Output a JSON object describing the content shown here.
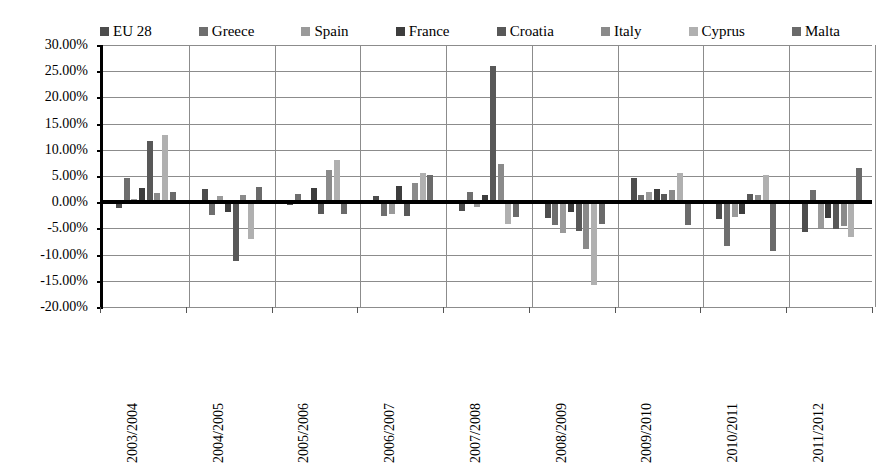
{
  "chart_data": {
    "type": "bar",
    "title": "",
    "subtitle": "",
    "xlabel": "",
    "ylabel": "",
    "ylim": [
      -20,
      30
    ],
    "ytick_step": 5,
    "ytick_labels": [
      "30.00%",
      "25.00%",
      "20.00%",
      "15.00%",
      "10.00%",
      "5.00%",
      "0.00%",
      "-5.00%",
      "-10.00%",
      "-15.00%",
      "-20.00%"
    ],
    "ytick_values": [
      30,
      25,
      20,
      15,
      10,
      5,
      0,
      -5,
      -10,
      -15,
      -20
    ],
    "grid": true,
    "legend_position": "top",
    "categories": [
      "2003/2004",
      "2004/2005",
      "2005/2006",
      "2006/2007",
      "2007/2008",
      "2008/2009",
      "2009/2010",
      "2010/2011",
      "2011/2012"
    ],
    "series": [
      {
        "name": "EU 28",
        "color": "#4d4d4d",
        "values": [
          -1.2,
          2.5,
          -0.6,
          1.2,
          -1.6,
          -3.0,
          4.6,
          -3.2,
          -5.6
        ]
      },
      {
        "name": "Greece",
        "color": "#6e6e6e",
        "values": [
          4.6,
          -2.4,
          1.5,
          -2.6,
          2.0,
          -4.4,
          1.3,
          -8.4,
          2.3
        ]
      },
      {
        "name": "Spain",
        "color": "#9a9a9a",
        "values": [
          0.6,
          1.2,
          -0.4,
          -2.2,
          -1.0,
          -5.8,
          2.0,
          -2.8,
          -5.0
        ]
      },
      {
        "name": "France",
        "color": "#3d3d3d",
        "values": [
          2.8,
          -1.8,
          2.7,
          3.0,
          1.4,
          -1.8,
          2.6,
          -2.2,
          -3.0
        ]
      },
      {
        "name": "Croatia",
        "color": "#585858",
        "values": [
          11.7,
          -11.3,
          -2.3,
          -2.6,
          26.0,
          -5.5,
          1.5,
          1.5,
          -5.2
        ]
      },
      {
        "name": "Italy",
        "color": "#8a8a8a",
        "values": [
          1.8,
          1.3,
          6.2,
          3.7,
          7.2,
          -9.0,
          2.3,
          1.4,
          -4.6
        ]
      },
      {
        "name": "Cyprus",
        "color": "#b0b0b0",
        "values": [
          12.8,
          -7.0,
          8.0,
          5.6,
          -4.2,
          -15.8,
          5.6,
          5.2,
          -6.6
        ]
      },
      {
        "name": "Malta",
        "color": "#6a6a6a",
        "values": [
          2.0,
          2.9,
          -2.2,
          5.2,
          -2.9,
          -4.1,
          -4.3,
          -9.3,
          6.6
        ]
      }
    ]
  },
  "legend": {
    "items": [
      {
        "label": "EU 28",
        "color": "#4d4d4d"
      },
      {
        "label": "Greece",
        "color": "#6e6e6e"
      },
      {
        "label": "Spain",
        "color": "#9a9a9a"
      },
      {
        "label": "France",
        "color": "#3d3d3d"
      },
      {
        "label": "Croatia",
        "color": "#585858"
      },
      {
        "label": "Italy",
        "color": "#8a8a8a"
      },
      {
        "label": "Cyprus",
        "color": "#b0b0b0"
      },
      {
        "label": "Malta",
        "color": "#6a6a6a"
      }
    ]
  },
  "axes": {
    "zero_label": "0.00%"
  }
}
